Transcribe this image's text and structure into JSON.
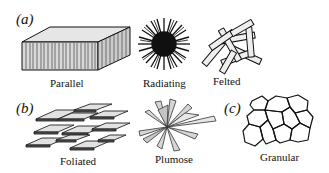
{
  "figure": {
    "panels": [
      {
        "label": "(a)",
        "items": [
          {
            "name": "Parallel",
            "icon": "parallel-block-icon"
          },
          {
            "name": "Radiating",
            "icon": "radiating-sphere-icon"
          },
          {
            "name": "Felted",
            "icon": "felted-rods-icon"
          }
        ]
      },
      {
        "label": "(b)",
        "items": [
          {
            "name": "Foliated",
            "icon": "foliated-plates-icon"
          },
          {
            "name": "Plumose",
            "icon": "plumose-blades-icon"
          }
        ]
      },
      {
        "label": "(c)",
        "items": [
          {
            "name": "Granular",
            "icon": "granular-polygons-icon"
          }
        ]
      }
    ],
    "colors": {
      "line": "#111111",
      "fill_light": "#e2e2e2",
      "fill_face": "#cfcfcf",
      "background": "#ffffff"
    }
  }
}
